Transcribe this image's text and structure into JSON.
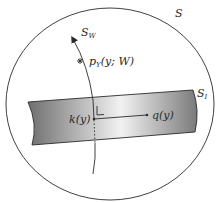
{
  "diagram": {
    "labels": {
      "S": "S",
      "S_W_main": "S",
      "S_W_sub": "W",
      "S_I_main": "S",
      "S_I_sub": "I",
      "p_main": "p",
      "p_sub": "Y",
      "p_args": "(y; W)",
      "k": "k(y)",
      "q": "q(y)"
    },
    "colors": {
      "stroke": "#2a2a2a",
      "band_dark": "#6e6e6e",
      "band_light": "#f4f4f4",
      "background": "#ffffff"
    }
  }
}
